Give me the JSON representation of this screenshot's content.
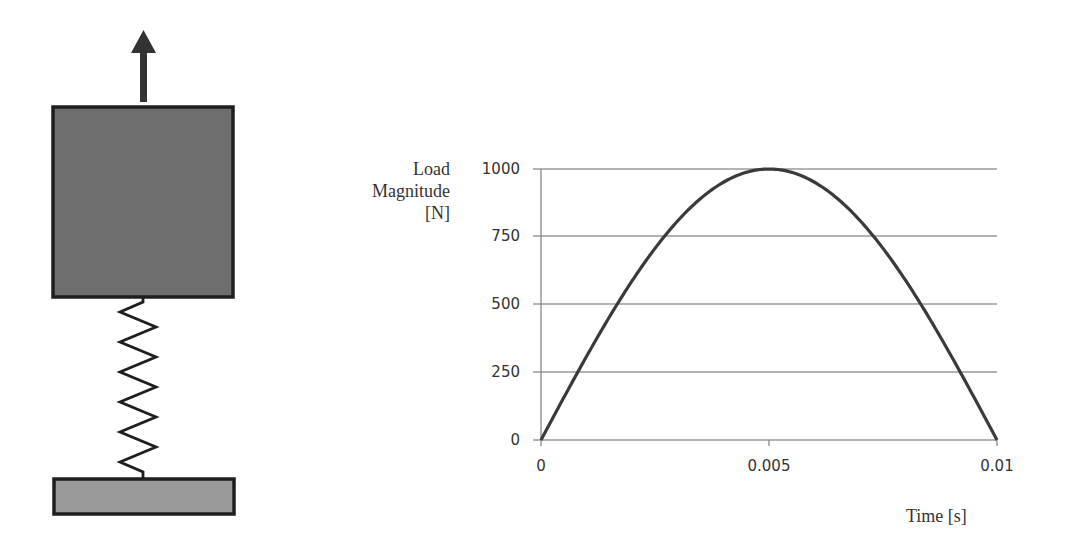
{
  "diagram": {
    "elements": [
      "upward-force-arrow",
      "mass-block",
      "spring",
      "fixed-base"
    ],
    "colors": {
      "mass": "#6e6e6e",
      "base": "#9a9a9a",
      "outline": "#222222",
      "arrow": "#333333"
    }
  },
  "chart": {
    "ylabel_lines": [
      "Load",
      "Magnitude",
      "[N]"
    ],
    "xlabel": "Time [s]",
    "yticks": [
      "1000",
      "750",
      "500",
      "250",
      "0"
    ],
    "xticks": [
      "0",
      "0.005",
      "0.01"
    ]
  },
  "chart_data": {
    "type": "line",
    "title": "",
    "xlabel": "Time [s]",
    "ylabel": "Load Magnitude [N]",
    "xlim": [
      0,
      0.01
    ],
    "ylim": [
      0,
      1000
    ],
    "x_ticks": [
      0,
      0.005,
      0.01
    ],
    "y_ticks": [
      0,
      250,
      500,
      750,
      1000
    ],
    "grid": "horizontal",
    "legend": null,
    "series": [
      {
        "name": "Load",
        "description": "Half-sine pulse F(t) = 1000 sin(pi t / 0.01)",
        "x": [
          0,
          0.001,
          0.002,
          0.003,
          0.004,
          0.005,
          0.006,
          0.007,
          0.008,
          0.009,
          0.01
        ],
        "values": [
          0,
          309,
          588,
          809,
          951,
          1000,
          951,
          809,
          588,
          309,
          0
        ]
      }
    ]
  }
}
